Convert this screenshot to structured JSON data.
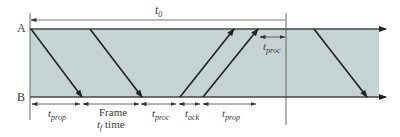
{
  "diagram": {
    "type": "timing-diagram",
    "colors": {
      "band": "#c5d3d3",
      "line": "#222222",
      "axis": "#555555",
      "text": "#3a3a3a"
    },
    "stations": [
      {
        "label": "A",
        "y": 29
      },
      {
        "label": "B",
        "y": 97
      }
    ],
    "top_interval": {
      "symbol": "t",
      "subscript": "0"
    },
    "top_proc": {
      "symbol": "t",
      "subscript": "proc"
    },
    "bottom_intervals": [
      {
        "symbol": "t",
        "subscript": "prop"
      },
      {
        "prefix": "Frame",
        "symbol": "t",
        "subscript": "f",
        "suffix": "time"
      },
      {
        "symbol": "t",
        "subscript": "proc"
      },
      {
        "symbol": "t",
        "subscript": "ack"
      },
      {
        "symbol": "t",
        "subscript": "prop"
      }
    ],
    "signals": [
      {
        "from": "A",
        "to": "B",
        "x1": 31,
        "x2": 82,
        "kind": "frame-start"
      },
      {
        "from": "A",
        "to": "B",
        "x1": 90,
        "x2": 142,
        "kind": "frame-end"
      },
      {
        "from": "B",
        "to": "A",
        "x1": 180,
        "x2": 234,
        "kind": "ack-start"
      },
      {
        "from": "B",
        "to": "A",
        "x1": 203,
        "x2": 258,
        "kind": "ack-end"
      },
      {
        "from": "A",
        "to": "B",
        "x1": 314,
        "x2": 367,
        "kind": "next-frame"
      }
    ]
  }
}
